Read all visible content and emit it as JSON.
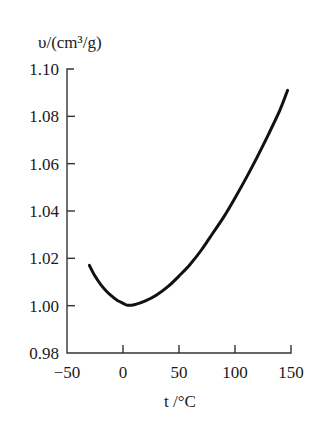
{
  "chart_data": {
    "type": "line",
    "title": "",
    "xlabel": "t /°C",
    "ylabel": "υ/(cm³/g)",
    "xlim": [
      -50,
      150
    ],
    "ylim": [
      0.98,
      1.1
    ],
    "xticks": [
      -50,
      0,
      50,
      100,
      150
    ],
    "xtick_labels": [
      "−50",
      "0",
      "50",
      "100",
      "150"
    ],
    "yticks": [
      0.98,
      1.0,
      1.02,
      1.04,
      1.06,
      1.08,
      1.1
    ],
    "ytick_labels": [
      "0.98",
      "1.00",
      "1.02",
      "1.04",
      "1.06",
      "1.08",
      "1.10"
    ],
    "grid": false,
    "legend": null,
    "series": [
      {
        "name": "specific volume",
        "color": "#111111",
        "x": [
          -30,
          -25,
          -20,
          -15,
          -10,
          -5,
          0,
          4,
          10,
          20,
          30,
          40,
          50,
          60,
          70,
          80,
          90,
          100,
          110,
          120,
          130,
          140,
          147
        ],
        "values": [
          1.017,
          1.0125,
          1.009,
          1.0062,
          1.004,
          1.0022,
          1.001,
          1.0002,
          1.0004,
          1.002,
          1.0045,
          1.008,
          1.0125,
          1.0175,
          1.0235,
          1.0305,
          1.0375,
          1.0455,
          1.054,
          1.063,
          1.0725,
          1.0825,
          1.091
        ]
      }
    ]
  }
}
